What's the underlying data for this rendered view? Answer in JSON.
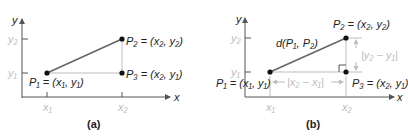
{
  "colors": {
    "axis": "#555555",
    "segment": "#666666",
    "guide": "#bdbdbd",
    "point": "#111111",
    "text": "#222222",
    "light_text": "#bdbdbd"
  },
  "panels": [
    {
      "caption": "(a)",
      "axis_x_label": "x",
      "axis_y_label": "y",
      "tick_labels": {
        "x1": "x₁",
        "x2": "x₂",
        "y1": "y₁",
        "y2": "y₂"
      },
      "points": {
        "p1": "P₁ = (x₁, y₁)",
        "p2": "P₂ = (x₂, y₂)",
        "p3": "P₃ = (x₂, y₁)"
      }
    },
    {
      "caption": "(b)",
      "axis_x_label": "x",
      "axis_y_label": "y",
      "tick_labels": {
        "x1": "x₁",
        "x2": "x₂",
        "y1": "y₁",
        "y2": "y₂"
      },
      "points": {
        "p1": "P₁ = (x₁, y₁)",
        "p2": "P₂ = (x₂, y₂)",
        "p3": "P₃ = (x₂, y₁)"
      },
      "distance_label": "d(P₁, P₂)",
      "horizontal_measure": "|x₂ − x₁|",
      "vertical_measure": "|y₂ − y₁|"
    }
  ]
}
